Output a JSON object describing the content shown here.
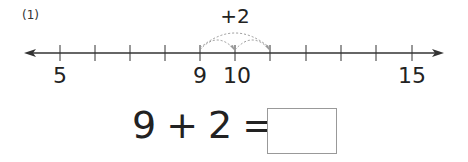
{
  "problem": {
    "number_label": "(1)"
  },
  "number_line": {
    "min_visible": 5,
    "max_visible": 15,
    "labeled_ticks": [
      {
        "value": 5,
        "label": "5"
      },
      {
        "value": 9,
        "label": "9"
      },
      {
        "value": 10,
        "label": "10"
      },
      {
        "value": 15,
        "label": "15"
      }
    ],
    "start": 9,
    "jumps": [
      {
        "from": 9,
        "to": 10
      },
      {
        "from": 10,
        "to": 11
      },
      {
        "from": 9,
        "to": 11
      }
    ],
    "jump_label": "+2",
    "line_color": "#333333",
    "arc_color": "#999999"
  },
  "equation": {
    "left": "9",
    "operator": "+",
    "right": "2",
    "equals": "=",
    "answer": ""
  }
}
